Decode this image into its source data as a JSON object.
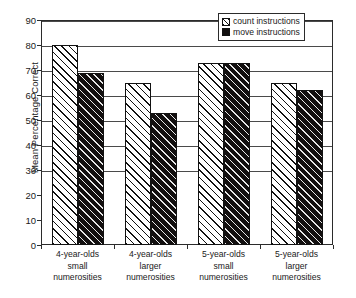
{
  "chart_data": {
    "type": "bar",
    "title": "",
    "xlabel": "",
    "ylabel": "Mean Percentage Correct",
    "ylim": [
      0,
      90
    ],
    "ytick_step": 10,
    "yticks": [
      90,
      80,
      70,
      60,
      50,
      40,
      30,
      20,
      10,
      0
    ],
    "gridlines": [
      90,
      80,
      70,
      60,
      50,
      40,
      30
    ],
    "grid": true,
    "legend_position": "top-right",
    "categories": [
      "4-year-olds small numerosities",
      "4-year-olds larger numerosities",
      "5-year-olds small numerosities",
      "5-year-olds larger numerosities"
    ],
    "category_lines": [
      [
        "4-year-olds",
        "small",
        "numerosities"
      ],
      [
        "4-year-olds",
        "larger",
        "numerosities"
      ],
      [
        "5-year-olds",
        "small",
        "numerosities"
      ],
      [
        "5-year-olds",
        "larger",
        "numerosities"
      ]
    ],
    "series": [
      {
        "name": "count instructions",
        "fill": "white-hatched",
        "values": [
          80,
          65,
          73,
          65
        ]
      },
      {
        "name": "move instructions",
        "fill": "black-hatched",
        "values": [
          69,
          53,
          73,
          62
        ]
      }
    ]
  },
  "legend": {
    "items": [
      {
        "label": "count instructions",
        "swatch": "hatched-white-swatch"
      },
      {
        "label": "move instructions",
        "swatch": "filled-black-swatch"
      }
    ]
  },
  "colors": {
    "axis": "#2b2b2b",
    "grid": "#4a4a4a",
    "bar_outline": "#111111",
    "count_fill": "#ffffff",
    "move_fill": "#120f0f",
    "background": "#ffffff"
  }
}
